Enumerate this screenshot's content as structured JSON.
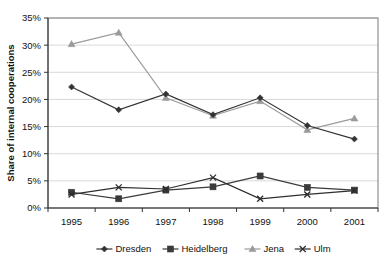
{
  "chart_data": {
    "type": "line",
    "title": "",
    "xlabel": "",
    "ylabel": "Share of internal cooperations",
    "categories": [
      "1995",
      "1996",
      "1997",
      "1998",
      "1999",
      "2000",
      "2001"
    ],
    "ylim": [
      0,
      35
    ],
    "ytick_labels": [
      "0%",
      "5%",
      "10%",
      "15%",
      "20%",
      "25%",
      "30%",
      "35%"
    ],
    "ytick_values": [
      0,
      5,
      10,
      15,
      20,
      25,
      30,
      35
    ],
    "grid": true,
    "legend_position": "bottom",
    "series": [
      {
        "name": "Dresden",
        "marker": "diamond",
        "color": "#333333",
        "values": [
          22.3,
          18.1,
          21.0,
          17.2,
          20.3,
          15.2,
          12.7
        ]
      },
      {
        "name": "Heidelberg",
        "marker": "square",
        "color": "#3a3a3a",
        "values": [
          2.9,
          1.7,
          3.3,
          3.9,
          5.9,
          3.8,
          3.3
        ]
      },
      {
        "name": "Jena",
        "marker": "triangle",
        "color": "#9a9a9a",
        "values": [
          30.2,
          32.3,
          20.3,
          17.0,
          19.7,
          14.4,
          16.5
        ]
      },
      {
        "name": "Ulm",
        "marker": "cross",
        "color": "#2e2e2e",
        "values": [
          2.5,
          3.8,
          3.5,
          5.6,
          1.7,
          2.5,
          3.2
        ]
      }
    ]
  },
  "legend": {
    "items": [
      {
        "label": "Dresden"
      },
      {
        "label": "Heidelberg"
      },
      {
        "label": "Jena"
      },
      {
        "label": "Ulm"
      }
    ]
  }
}
